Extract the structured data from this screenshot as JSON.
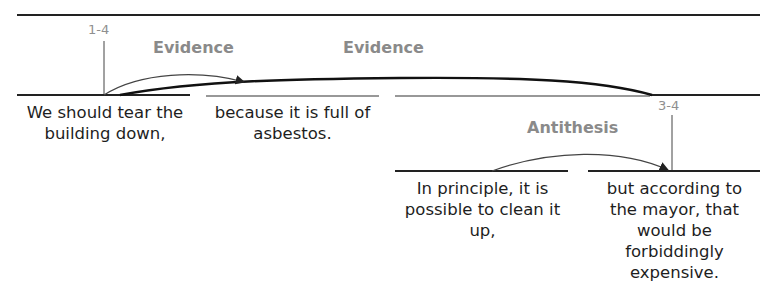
{
  "diagram": {
    "type": "rst-tree",
    "spans": [
      {
        "id": "1-4",
        "label": "1-4"
      },
      {
        "id": "3-4",
        "label": "3-4"
      }
    ],
    "relations": [
      {
        "name": "Evidence",
        "from": "segment-2",
        "to": "segment-1"
      },
      {
        "name": "Evidence",
        "from": "span-3-4",
        "to": "segment-1"
      },
      {
        "name": "Antithesis",
        "from": "segment-3",
        "to": "segment-4"
      }
    ],
    "segments": [
      {
        "text": "We should tear the building down,"
      },
      {
        "text": "because it is full of asbestos."
      },
      {
        "text": "In principle, it is possible to clean it up,"
      },
      {
        "text": "but according to the mayor, that would be forbiddingly expensive."
      }
    ]
  }
}
